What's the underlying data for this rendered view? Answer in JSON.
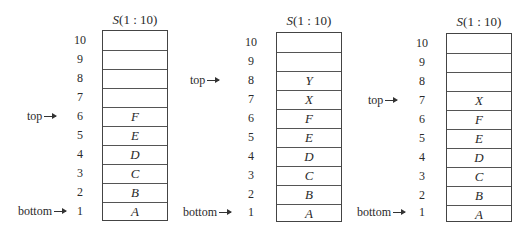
{
  "diagram": {
    "stacks": [
      {
        "title_prefix": "S",
        "title_suffix": "(1 : 10)",
        "indices": [
          "10",
          "9",
          "8",
          "7",
          "6",
          "5",
          "4",
          "3",
          "2",
          "1"
        ],
        "cells": [
          "",
          "",
          "",
          "",
          "F",
          "E",
          "D",
          "C",
          "B",
          "A"
        ],
        "top_label": "top",
        "top_index": 6,
        "bottom_label": "bottom",
        "bottom_index": 1
      },
      {
        "title_prefix": "S",
        "title_suffix": "(1 : 10)",
        "indices": [
          "10",
          "9",
          "8",
          "7",
          "6",
          "5",
          "4",
          "3",
          "2",
          "1"
        ],
        "cells": [
          "",
          "",
          "Y",
          "X",
          "F",
          "E",
          "D",
          "C",
          "B",
          "A"
        ],
        "top_label": "top",
        "top_index": 8,
        "bottom_label": "bottom",
        "bottom_index": 1
      },
      {
        "title_prefix": "S",
        "title_suffix": "(1 : 10)",
        "indices": [
          "10",
          "9",
          "8",
          "7",
          "6",
          "5",
          "4",
          "3",
          "2",
          "1"
        ],
        "cells": [
          "",
          "",
          "",
          "X",
          "F",
          "E",
          "D",
          "C",
          "B",
          "A"
        ],
        "top_label": "top",
        "top_index": 7,
        "bottom_label": "bottom",
        "bottom_index": 1
      }
    ]
  }
}
